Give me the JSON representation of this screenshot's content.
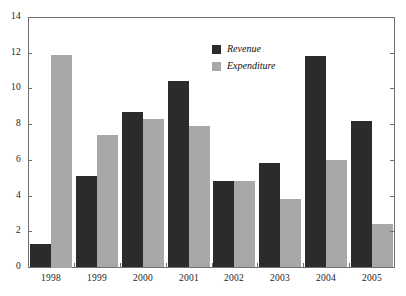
{
  "chart_data": {
    "type": "bar",
    "title": "",
    "xlabel": "",
    "ylabel": "",
    "ylim": [
      0,
      14
    ],
    "y_ticks": [
      0,
      2,
      4,
      6,
      8,
      10,
      12,
      14
    ],
    "grid": false,
    "legend_position": "top-center",
    "categories": [
      "1998",
      "1999",
      "2000",
      "2001",
      "2002",
      "2003",
      "2004",
      "2005"
    ],
    "series": [
      {
        "name": "Revenue",
        "color": "#2b2b2b",
        "values": [
          1.3,
          5.1,
          8.7,
          10.4,
          4.8,
          5.8,
          11.8,
          8.2
        ]
      },
      {
        "name": "Expenditure",
        "color": "#a8a8a8",
        "values": [
          11.9,
          7.4,
          8.3,
          7.9,
          4.8,
          3.8,
          6.0,
          2.4
        ]
      }
    ]
  },
  "axes": {
    "y_tick_labels": [
      "0",
      "2",
      "4",
      "6",
      "8",
      "10",
      "12",
      "14"
    ],
    "x_tick_labels": [
      "1998",
      "1999",
      "2000",
      "2001",
      "2002",
      "2003",
      "2004",
      "2005"
    ]
  },
  "legend": {
    "entries": [
      {
        "label": "Revenue",
        "swatch_color": "#2b2b2b"
      },
      {
        "label": "Expenditure",
        "swatch_color": "#a8a8a8"
      }
    ]
  },
  "colors": {
    "revenue": "#2b2b2b",
    "expenditure": "#a8a8a8",
    "frame": "#6f6f6f",
    "text": "#1a1a1a",
    "background": "#ffffff"
  }
}
